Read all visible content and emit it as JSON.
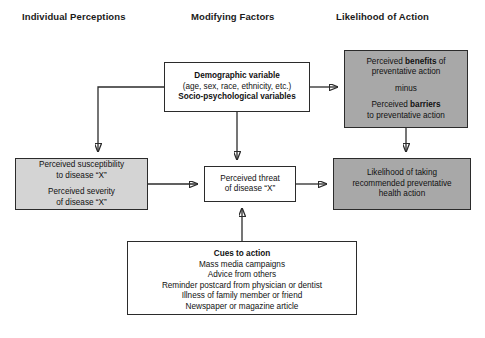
{
  "headers": {
    "individual": "Individual Perceptions",
    "modifying": "Modifying Factors",
    "likelihood": "Likelihood of Action"
  },
  "nodes": {
    "demographic": {
      "line1": "Demographic variable",
      "line2": "(age, sex, race, ethnicity, etc.)",
      "line3": "Socio-psychological variables"
    },
    "benefits": {
      "line1a": "Perceived ",
      "line1b": "benefits",
      "line1c": " of",
      "line2": "preventative action",
      "line3": "minus",
      "line4a": "Perceived ",
      "line4b": "barriers",
      "line5": "to preventative action"
    },
    "perceptions": {
      "line1": "Perceived susceptibility",
      "line2": "to disease “X”",
      "line3": "Perceived severity",
      "line4": "of disease “X”"
    },
    "threat": {
      "line1": "Perceived threat",
      "line2": "of disease “X”"
    },
    "likelihood": {
      "line1": "Likelihood of taking",
      "line2": "recommended preventative",
      "line3": "health action"
    },
    "cues": {
      "title": "Cues to action",
      "item1": "Mass media campaigns",
      "item2": "Advice from others",
      "item3": "Reminder postcard from physician or dentist",
      "item4": "Illness of family member or friend",
      "item5": "Newspaper or magazine article"
    }
  },
  "colors": {
    "outline": "#2b2b2b",
    "fill_white": "#ffffff",
    "fill_light_gray": "#d4d4d4",
    "fill_dark_gray": "#a8a8a8",
    "text": "#111111"
  }
}
